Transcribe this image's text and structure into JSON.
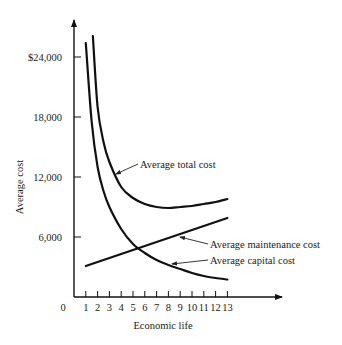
{
  "chart_data": {
    "type": "line",
    "title": "",
    "xlabel": "Economic life",
    "ylabel": "Average cost",
    "xlim": [
      0,
      13
    ],
    "ylim": [
      0,
      26000
    ],
    "grid": false,
    "legend_position": "inline labels with leader arrows",
    "x_ticks": [
      "0",
      "1",
      "2",
      "3",
      "4",
      "5",
      "6",
      "7",
      "8",
      "9",
      "10",
      "11",
      "12",
      "13"
    ],
    "y_ticks": [
      "$24,000",
      "18,000",
      "12,000",
      "6,000"
    ],
    "y_tick_values": [
      24000,
      18000,
      12000,
      6000
    ],
    "series": [
      {
        "name": "Average total cost",
        "x": [
          1.6,
          2,
          2.5,
          3,
          4,
          5,
          6,
          7,
          8,
          9,
          10,
          11,
          12,
          13
        ],
        "values": [
          26100,
          19000,
          15500,
          13500,
          11000,
          9900,
          9300,
          9000,
          8900,
          9000,
          9100,
          9300,
          9500,
          9800
        ]
      },
      {
        "name": "Average maintenance cost",
        "x": [
          1,
          13
        ],
        "values": [
          3100,
          7900
        ]
      },
      {
        "name": "Average capital cost",
        "x": [
          1,
          1.5,
          2,
          2.5,
          3,
          4,
          5,
          6,
          7,
          8,
          9,
          10,
          11,
          12,
          13
        ],
        "values": [
          25400,
          17500,
          13000,
          10600,
          9000,
          6800,
          5300,
          4400,
          3700,
          3200,
          2800,
          2400,
          2100,
          1900,
          1750
        ]
      }
    ],
    "annotations": [
      {
        "text": "Average total cost",
        "points_to_x": 3.4
      },
      {
        "text": "Average maintenance cost",
        "points_to_x": 9.8
      },
      {
        "text": "Average capital cost",
        "points_to_x": 8.2
      }
    ]
  },
  "labels": {
    "xlabel": "Economic life",
    "ylabel": "Average cost",
    "origin": "0",
    "total": "Average total cost",
    "maintenance": "Average maintenance cost",
    "capital": "Average capital cost"
  }
}
